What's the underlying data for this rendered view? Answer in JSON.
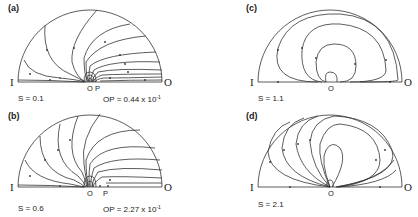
{
  "figure": {
    "endpoint_labels": {
      "left": "I",
      "right": "O"
    },
    "panels": [
      {
        "id": "a",
        "label": "(a)",
        "s_label": "S = 0.1",
        "points": [
          "O",
          "P"
        ],
        "op_label": "OP = 0.44 x 10",
        "op_exp": "-1"
      },
      {
        "id": "b",
        "label": "(b)",
        "s_label": "S = 0.6",
        "points": [
          "O",
          "P"
        ],
        "op_label": "OP = 2.27 x 10",
        "op_exp": "-1"
      },
      {
        "id": "c",
        "label": "(c)",
        "s_label": "S = 1.1",
        "points": [
          "O"
        ]
      },
      {
        "id": "d",
        "label": "(d)",
        "s_label": "S = 2.1",
        "points": [
          "O"
        ]
      }
    ]
  },
  "colors": {
    "line": "#333333",
    "background": "#ffffff"
  }
}
